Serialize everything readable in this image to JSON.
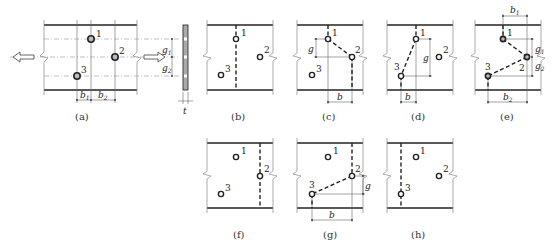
{
  "figure": {
    "holes": [
      "1",
      "2",
      "3"
    ],
    "panels": [
      {
        "id": "a",
        "label": "(a)",
        "content": "Plate with three staggered holes, tension arrows, side view",
        "dims": [
          "b1",
          "b2",
          "g1",
          "g2",
          "t"
        ]
      },
      {
        "id": "b",
        "label": "(b)",
        "failure_path": "straight section through hole 1",
        "dims": []
      },
      {
        "id": "c",
        "label": "(c)",
        "failure_path": "zigzag 1-2",
        "dims": [
          "g",
          "b"
        ]
      },
      {
        "id": "d",
        "label": "(d)",
        "failure_path": "zigzag 3-1",
        "dims": [
          "g",
          "b"
        ]
      },
      {
        "id": "e",
        "label": "(e)",
        "failure_path": "zigzag 1-2-3",
        "dims": [
          "b1",
          "b2",
          "g1",
          "g2"
        ]
      },
      {
        "id": "f",
        "label": "(f)",
        "failure_path": "straight section through hole 2",
        "dims": []
      },
      {
        "id": "g",
        "label": "(g)",
        "failure_path": "zigzag 3-2",
        "dims": [
          "g",
          "b"
        ]
      },
      {
        "id": "h",
        "label": "(h)",
        "failure_path": "straight section through hole 3",
        "dims": []
      }
    ]
  },
  "labels": {
    "a": "(a)",
    "b": "(b)",
    "c": "(c)",
    "d": "(d)",
    "e": "(e)",
    "f": "(f)",
    "g": "(g)",
    "h": "(h)"
  },
  "dims": {
    "b": "b",
    "g": "g",
    "t": "t",
    "b_base": "b",
    "g_base": "g",
    "sub1": "1",
    "sub2": "2"
  },
  "hole_numbers": {
    "h1": "1",
    "h2": "2",
    "h3": "3"
  },
  "colors": {
    "line": "#222222",
    "guide": "#999999",
    "background": "#ffffff"
  }
}
